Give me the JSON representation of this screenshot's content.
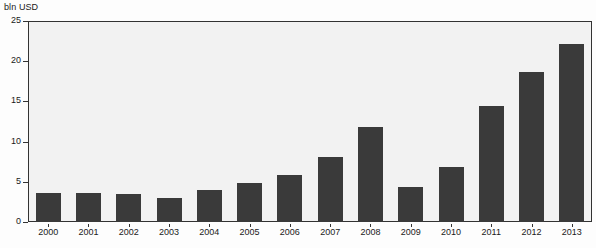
{
  "chart_data": {
    "type": "bar",
    "title": "",
    "unit_label": "bln USD",
    "xlabel": "",
    "ylabel": "bln USD",
    "categories": [
      "2000",
      "2001",
      "2002",
      "2003",
      "2004",
      "2005",
      "2006",
      "2007",
      "2008",
      "2009",
      "2010",
      "2011",
      "2012",
      "2013"
    ],
    "values": [
      3.6,
      3.6,
      3.5,
      3.0,
      4.0,
      4.9,
      5.9,
      8.1,
      11.8,
      4.3,
      6.8,
      14.4,
      18.7,
      22.1
    ],
    "ylim": [
      0,
      25
    ],
    "yticks": [
      0,
      5,
      10,
      15,
      20,
      25
    ],
    "ytick_labels": [
      "0",
      "5",
      "10",
      "15",
      "20",
      "25"
    ],
    "grid": false,
    "legend": null,
    "series": [
      {
        "name": "",
        "values": [
          3.6,
          3.6,
          3.5,
          3.0,
          4.0,
          4.9,
          5.9,
          8.1,
          11.8,
          4.3,
          6.8,
          14.4,
          18.7,
          22.1
        ]
      }
    ]
  },
  "colors": {
    "bar": "#3a3a3a",
    "plot_background": "#f2f2f2",
    "page_background": "#fdfdfd",
    "axis": "#333333",
    "text": "#1a1a1a"
  }
}
